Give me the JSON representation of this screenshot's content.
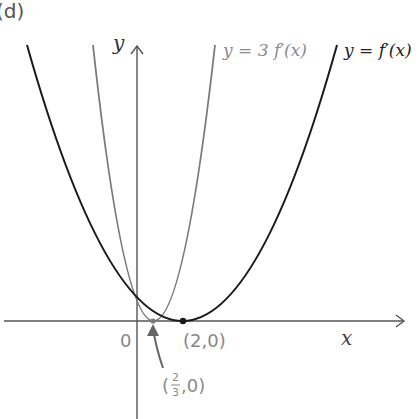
{
  "figure": {
    "part_label": "(d)",
    "axis_x_label": "x",
    "axis_y_label": "y",
    "origin_label": "0",
    "point_vertex_dark_label": "(2,0)",
    "point_vertex_light_label_prefix": "(",
    "point_vertex_light_frac_num": "2",
    "point_vertex_light_frac_den": "3",
    "point_vertex_light_label_suffix": ",0)",
    "curve_dark_label": "y = f′(x)",
    "curve_light_label": "y = 3 f′(x)"
  },
  "colors": {
    "dark_curve": "#1a1a1a",
    "light_curve": "#7a7a7a",
    "light_label": "#8a8a8a",
    "axis": "#555555"
  }
}
